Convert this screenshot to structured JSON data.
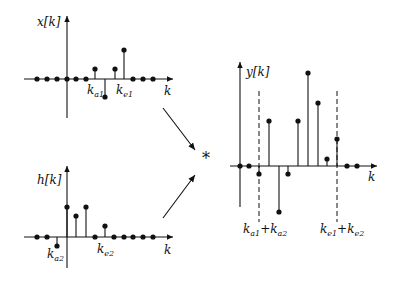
{
  "colors": {
    "ink": "#111111",
    "background": "#ffffff"
  },
  "operator": {
    "symbol": "*",
    "x": 206,
    "y": 164
  },
  "plots": [
    {
      "id": "x",
      "label": "x[k]",
      "label_pos": [
        37,
        26
      ],
      "origin": [
        67,
        79
      ],
      "x_axis": [
        24,
        173
      ],
      "y_axis": [
        118,
        16
      ],
      "axis_label": "k",
      "axis_label_pos": [
        164,
        95
      ],
      "samples": [
        {
          "x": 37,
          "y": 0
        },
        {
          "x": 47,
          "y": 0
        },
        {
          "x": 57,
          "y": 0
        },
        {
          "x": 67,
          "y": 0
        },
        {
          "x": 76,
          "y": 0
        },
        {
          "x": 86,
          "y": 0
        },
        {
          "x": 95,
          "y": 10
        },
        {
          "x": 105,
          "y": -18
        },
        {
          "x": 115,
          "y": 10
        },
        {
          "x": 124,
          "y": 29
        },
        {
          "x": 133,
          "y": 0
        },
        {
          "x": 143,
          "y": 0
        },
        {
          "x": 153,
          "y": 0
        }
      ],
      "annotations": [
        {
          "main": "k",
          "sub": "a1",
          "x": 87,
          "y": 94
        },
        {
          "main": "k",
          "sub": "e1",
          "x": 116,
          "y": 94
        }
      ],
      "dashed": []
    },
    {
      "id": "h",
      "label": "h[k]",
      "label_pos": [
        37,
        184
      ],
      "origin": [
        67,
        237
      ],
      "x_axis": [
        24,
        173
      ],
      "y_axis": [
        268,
        166
      ],
      "axis_label": "k",
      "axis_label_pos": [
        164,
        254
      ],
      "samples": [
        {
          "x": 37,
          "y": 0
        },
        {
          "x": 47,
          "y": 0
        },
        {
          "x": 57,
          "y": -9
        },
        {
          "x": 67,
          "y": 30
        },
        {
          "x": 76,
          "y": 21
        },
        {
          "x": 86,
          "y": 30
        },
        {
          "x": 95,
          "y": 0
        },
        {
          "x": 105,
          "y": 11
        },
        {
          "x": 114,
          "y": 0
        },
        {
          "x": 124,
          "y": 0
        },
        {
          "x": 133,
          "y": 0
        },
        {
          "x": 143,
          "y": 0
        },
        {
          "x": 153,
          "y": 0
        }
      ],
      "annotations": [
        {
          "main": "k",
          "sub": "a2",
          "x": 47,
          "y": 258
        },
        {
          "main": "k",
          "sub": "e2",
          "x": 97,
          "y": 253
        }
      ],
      "dashed": []
    },
    {
      "id": "y",
      "label": "y[k]",
      "label_pos": [
        246,
        76
      ],
      "origin": [
        240,
        166
      ],
      "x_axis": [
        230,
        377
      ],
      "y_axis": [
        207,
        62
      ],
      "axis_label": "k",
      "axis_label_pos": [
        368,
        181
      ],
      "samples": [
        {
          "x": 240,
          "y": 0
        },
        {
          "x": 249,
          "y": 0
        },
        {
          "x": 259,
          "y": -8
        },
        {
          "x": 269,
          "y": 45
        },
        {
          "x": 279,
          "y": -46
        },
        {
          "x": 288,
          "y": -8
        },
        {
          "x": 298,
          "y": 45
        },
        {
          "x": 308,
          "y": 93
        },
        {
          "x": 318,
          "y": 63
        },
        {
          "x": 327,
          "y": 7
        },
        {
          "x": 337,
          "y": 27
        },
        {
          "x": 347,
          "y": 0
        },
        {
          "x": 357,
          "y": 0
        }
      ],
      "annotations": [
        {
          "main": "k",
          "sub": "a1",
          "x": 243,
          "y": 233,
          "plus": true,
          "main2": "k",
          "sub2": "a2"
        },
        {
          "main": "k",
          "sub": "e1",
          "x": 320,
          "y": 233,
          "plus": true,
          "main2": "k",
          "sub2": "e2"
        }
      ],
      "dashed": [
        {
          "x": 259,
          "y1": 91,
          "y2": 222
        },
        {
          "x": 337,
          "y1": 91,
          "y2": 222
        }
      ]
    }
  ],
  "arrows": [
    {
      "from": [
        163,
        108
      ],
      "to": [
        195,
        150
      ]
    },
    {
      "from": [
        163,
        218
      ],
      "to": [
        195,
        175
      ]
    }
  ]
}
